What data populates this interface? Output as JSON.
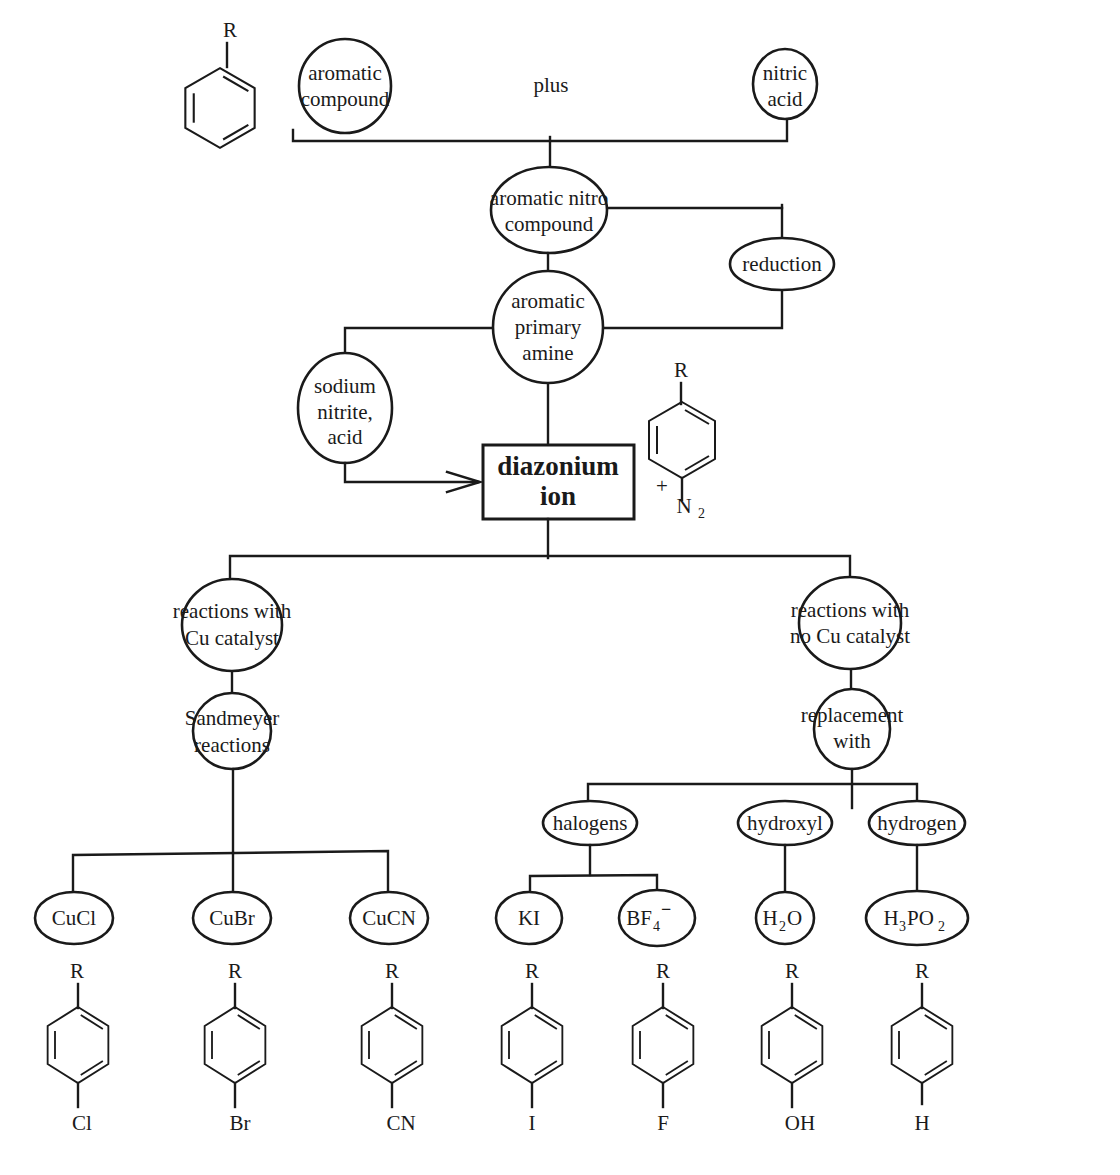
{
  "diagram": {
    "colors": {
      "ink": "#1a1a1a",
      "background": "#ffffff"
    },
    "start": {
      "aromatic_compound": [
        "aromatic",
        "compound"
      ],
      "plus_label": "plus",
      "nitric_acid": [
        "nitric",
        "acid"
      ],
      "benzene_substituent": "R"
    },
    "nitro_compound": [
      "aromatic nitro",
      "compound"
    ],
    "reduction": "reduction",
    "primary_amine": [
      "aromatic",
      "primary",
      "amine"
    ],
    "sodium_nitrite": [
      "sodium",
      "nitrite,",
      "acid"
    ],
    "diazonium": {
      "label": [
        "diazonium",
        "ion"
      ],
      "structure_top": "R",
      "structure_bottom_charge": "+",
      "structure_bottom": "N",
      "structure_bottom_sub": "2"
    },
    "branches": {
      "cu": {
        "label": [
          "reactions with",
          "Cu catalyst"
        ],
        "sub_label": [
          "Sandmeyer",
          "reactions"
        ],
        "reagents": [
          {
            "name": "CuCl",
            "top": "R",
            "product": "Cl"
          },
          {
            "name": "CuBr",
            "top": "R",
            "product": "Br"
          },
          {
            "name": "CuCN",
            "top": "R",
            "product": "CN"
          }
        ]
      },
      "no_cu": {
        "label": [
          "reactions with",
          "no Cu catalyst"
        ],
        "sub_label": [
          "replacement",
          "with"
        ],
        "groups": [
          {
            "name": "halogens"
          },
          {
            "name": "hydroxyl"
          },
          {
            "name": "hydrogen"
          }
        ],
        "reagents": [
          {
            "name": "KI",
            "base": "KI",
            "top": "R",
            "product": "I"
          },
          {
            "name": "BF4-",
            "base": "BF",
            "sub": "4",
            "sup": "−",
            "top": "R",
            "product": "F"
          },
          {
            "name": "H2O",
            "base": "H",
            "sub": "2",
            "rest": "O",
            "top": "R",
            "product": "OH"
          },
          {
            "name": "H3PO2",
            "base": "H",
            "sub": "3",
            "rest": "PO",
            "sub2": "2",
            "top": "R",
            "product": "H"
          }
        ]
      }
    }
  }
}
